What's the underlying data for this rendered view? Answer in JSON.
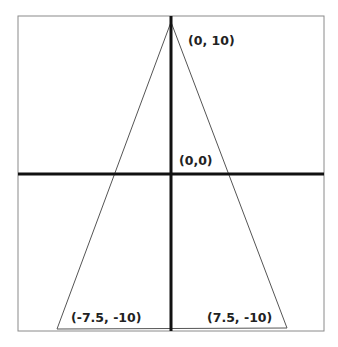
{
  "header_fragment": "",
  "diagram": {
    "type": "coordinate-triangle",
    "frame": {
      "x": 18,
      "y": 16,
      "width": 306,
      "height": 315,
      "stroke": "#8a8a8a"
    },
    "axes": {
      "color": "#111111",
      "thickness": 3,
      "x_axis": {
        "y": 174,
        "x1": 18,
        "x2": 324
      },
      "y_axis": {
        "x": 171,
        "y1": 16,
        "y2": 331
      }
    },
    "triangle": {
      "stroke": "#555555",
      "vertices": [
        {
          "x": 171,
          "y": 22,
          "label": "(0, 10)"
        },
        {
          "x": 57,
          "y": 329,
          "label": "(-7.5, -10)"
        },
        {
          "x": 287,
          "y": 328,
          "label": "(7.5, -10)"
        }
      ]
    },
    "labels": {
      "apex": "(0, 10)",
      "origin": "(0,0)",
      "bottom_left": "(-7.5, -10)",
      "bottom_right": "(7.5, -10)"
    }
  }
}
